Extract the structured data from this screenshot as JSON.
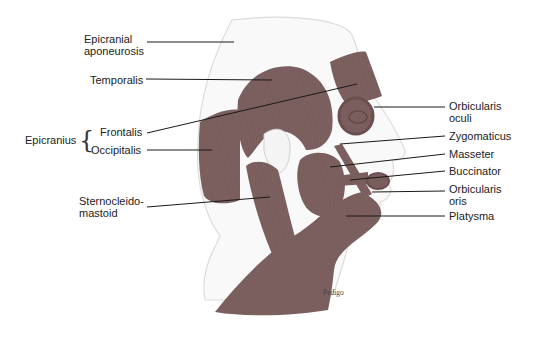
{
  "figure": {
    "credit": "Pedigo",
    "colors": {
      "muscle": "#7f6262",
      "muscle_dark": "#6e5252",
      "skin_outline": "#dcdcdc",
      "skin_fill": "#f9f9f9",
      "leader": "#1a1a1a",
      "label": "#222222"
    }
  },
  "labels": {
    "left": {
      "epicranial_aponeurosis": [
        "Epicranial",
        "aponeurosis"
      ],
      "temporalis": "Temporalis",
      "epicranius_group": "Epicranius",
      "frontalis": "Frontalis",
      "occipitalis": "Occipitalis",
      "sternocleidomastoid": [
        "Sternocleido-",
        "mastoid"
      ]
    },
    "right": {
      "orbicularis_oculi": [
        "Orbicularis",
        "oculi"
      ],
      "zygomaticus": "Zygomaticus",
      "masseter": "Masseter",
      "buccinator": "Buccinator",
      "orbicularis_oris": [
        "Orbicularis",
        "oris"
      ],
      "platysma": "Platysma"
    }
  }
}
